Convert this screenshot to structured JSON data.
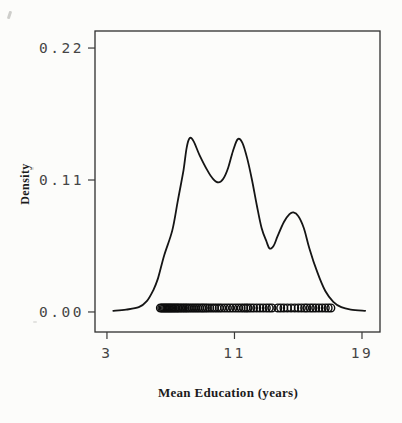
{
  "figure": {
    "background": "#fcfcfa",
    "box_color": "#2f2f2f",
    "curve_color": "#151515"
  },
  "chart_data": {
    "type": "line",
    "subtype": "kernel-density-estimate-with-rug",
    "title": "",
    "xlabel": "Mean Education (years)",
    "ylabel": "Density",
    "x_ticks": [
      "3",
      "11",
      "19"
    ],
    "x_tick_values": [
      3,
      11,
      19
    ],
    "y_ticks": [
      "0.00",
      "0.11",
      "0.22"
    ],
    "y_tick_values": [
      0.0,
      0.11,
      0.22
    ],
    "xlim": [
      2.25,
      20.13
    ],
    "ylim": [
      -0.0167,
      0.2342
    ],
    "grid": false,
    "legend": "none",
    "peaks": [
      {
        "x": 8.2,
        "density": 0.145
      },
      {
        "x": 11.2,
        "density": 0.144
      },
      {
        "x": 14.7,
        "density": 0.083
      }
    ],
    "density_curve": [
      [
        3.4,
        0.001
      ],
      [
        4.2,
        0.002
      ],
      [
        5.0,
        0.004
      ],
      [
        5.5,
        0.009
      ],
      [
        5.9,
        0.018
      ],
      [
        6.2,
        0.028
      ],
      [
        6.6,
        0.0475
      ],
      [
        7.1,
        0.068
      ],
      [
        7.45,
        0.093
      ],
      [
        7.8,
        0.118
      ],
      [
        8.0,
        0.137
      ],
      [
        8.2,
        0.145
      ],
      [
        8.45,
        0.142
      ],
      [
        8.8,
        0.131
      ],
      [
        9.3,
        0.118
      ],
      [
        9.65,
        0.111
      ],
      [
        10.0,
        0.108
      ],
      [
        10.3,
        0.111
      ],
      [
        10.6,
        0.12
      ],
      [
        10.9,
        0.134
      ],
      [
        11.2,
        0.144
      ],
      [
        11.5,
        0.141
      ],
      [
        11.8,
        0.128
      ],
      [
        12.1,
        0.11
      ],
      [
        12.4,
        0.089
      ],
      [
        12.7,
        0.07
      ],
      [
        13.0,
        0.059
      ],
      [
        13.2,
        0.053
      ],
      [
        13.45,
        0.055
      ],
      [
        13.7,
        0.063
      ],
      [
        14.1,
        0.075
      ],
      [
        14.45,
        0.0815
      ],
      [
        14.7,
        0.083
      ],
      [
        15.0,
        0.08
      ],
      [
        15.35,
        0.07
      ],
      [
        15.7,
        0.053
      ],
      [
        16.2,
        0.033
      ],
      [
        16.7,
        0.0175
      ],
      [
        17.2,
        0.0085
      ],
      [
        17.7,
        0.004
      ],
      [
        18.3,
        0.002
      ],
      [
        19.2,
        0.001
      ]
    ],
    "rug_points": [
      6.35,
      6.44,
      6.52,
      6.6,
      6.68,
      6.76,
      6.84,
      6.92,
      7.0,
      7.08,
      7.16,
      7.25,
      7.33,
      7.42,
      7.5,
      7.6,
      7.7,
      7.8,
      7.9,
      8.0,
      8.1,
      8.22,
      8.34,
      8.46,
      8.58,
      8.7,
      8.82,
      8.95,
      9.05,
      9.18,
      9.3,
      9.45,
      9.6,
      9.75,
      9.9,
      10.05,
      10.2,
      10.38,
      10.55,
      10.72,
      10.9,
      11.08,
      11.25,
      11.42,
      11.58,
      11.72,
      11.85,
      12.02,
      12.2,
      12.4,
      12.6,
      12.8,
      13.0,
      13.18,
      13.35,
      13.72,
      13.9,
      14.1,
      14.32,
      14.55,
      14.78,
      15.0,
      15.2,
      15.4,
      15.55,
      15.75,
      15.92,
      16.1,
      16.3,
      16.5,
      16.7,
      16.88,
      17.05
    ]
  }
}
